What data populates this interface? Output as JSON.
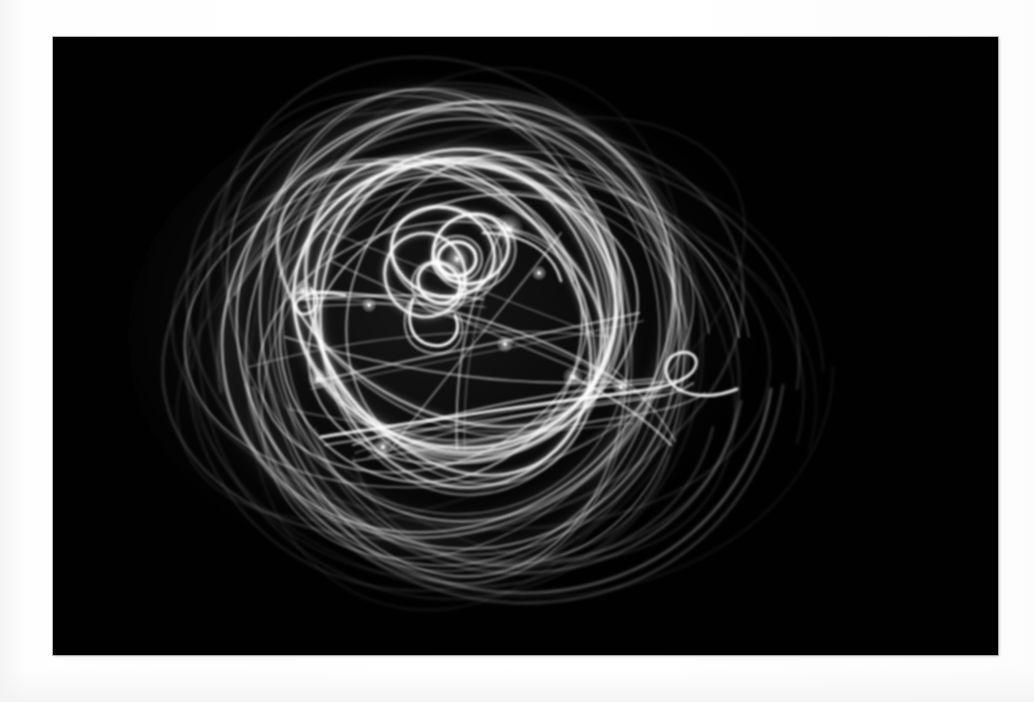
{
  "image": {
    "title": "Light painting long exposure",
    "subject_description": "Dense tangle of overlapping white light trails forming nested loops and ellipses",
    "medium": "photographic print on white paper",
    "orientation": "landscape",
    "canvas": {
      "width": 1034,
      "height": 702
    },
    "print_area": {
      "x": 53,
      "y": 37,
      "width": 945,
      "height": 618
    },
    "caption": ""
  },
  "colors": {
    "page_background": "#fdfdfd",
    "paper_white": "#ffffff",
    "paper_edge_gray": "#f2f2f2",
    "print_background": "#010101",
    "trail_bright": "#ffffff",
    "trail_mid": "#c8c8c8",
    "trail_faint": "#4a4a4a",
    "print_border": "#787878"
  },
  "chart_data": {
    "type": "scatter",
    "xlabel": "",
    "ylabel": "",
    "xlim": [
      0,
      945
    ],
    "ylim": [
      0,
      618
    ],
    "grid": false,
    "legend": "none",
    "trail_bundle": {
      "center": [
        405,
        290
      ],
      "extent_x": [
        130,
        740
      ],
      "extent_y": [
        105,
        555
      ],
      "bright_core": [
        330,
        230,
        560,
        400
      ]
    },
    "series": [
      {
        "name": "outer-ellipse-1",
        "cx": 400,
        "cy": 295,
        "rx": 295,
        "ry": 200,
        "rot": -14,
        "opacity": 0.3,
        "width": 1.8
      },
      {
        "name": "outer-ellipse-2",
        "cx": 410,
        "cy": 300,
        "rx": 285,
        "ry": 215,
        "rot": 22,
        "opacity": 0.26,
        "width": 1.6
      },
      {
        "name": "outer-ellipse-3",
        "cx": 395,
        "cy": 285,
        "rx": 275,
        "ry": 230,
        "rot": 64,
        "opacity": 0.24,
        "width": 1.5
      },
      {
        "name": "outer-ellipse-4",
        "cx": 415,
        "cy": 305,
        "rx": 300,
        "ry": 185,
        "rot": 5,
        "opacity": 0.22,
        "width": 1.4
      },
      {
        "name": "mid-ellipse-1",
        "cx": 395,
        "cy": 280,
        "rx": 235,
        "ry": 205,
        "rot": -35,
        "opacity": 0.48,
        "width": 2.2
      },
      {
        "name": "mid-ellipse-2",
        "cx": 405,
        "cy": 290,
        "rx": 225,
        "ry": 215,
        "rot": 40,
        "opacity": 0.45,
        "width": 2.1
      },
      {
        "name": "mid-ellipse-3",
        "cx": 390,
        "cy": 295,
        "rx": 245,
        "ry": 180,
        "rot": 78,
        "opacity": 0.42,
        "width": 2.0
      },
      {
        "name": "mid-ellipse-4",
        "cx": 420,
        "cy": 275,
        "rx": 215,
        "ry": 195,
        "rot": -62,
        "opacity": 0.4,
        "width": 1.9
      },
      {
        "name": "core-ellipse-1",
        "cx": 400,
        "cy": 270,
        "rx": 160,
        "ry": 140,
        "rot": 12,
        "opacity": 0.78,
        "width": 2.6
      },
      {
        "name": "core-ellipse-2",
        "cx": 410,
        "cy": 265,
        "rx": 150,
        "ry": 150,
        "rot": -30,
        "opacity": 0.74,
        "width": 2.5
      },
      {
        "name": "core-ellipse-3",
        "cx": 395,
        "cy": 280,
        "rx": 170,
        "ry": 125,
        "rot": 55,
        "opacity": 0.7,
        "width": 2.4
      },
      {
        "name": "inner-loop-1",
        "cx": 390,
        "cy": 215,
        "rx": 52,
        "ry": 44,
        "rot": 18,
        "opacity": 0.92,
        "width": 3.0
      },
      {
        "name": "inner-loop-2",
        "cx": 418,
        "cy": 212,
        "rx": 38,
        "ry": 34,
        "rot": -24,
        "opacity": 0.95,
        "width": 3.0
      },
      {
        "name": "inner-loop-3",
        "cx": 372,
        "cy": 238,
        "rx": 42,
        "ry": 40,
        "rot": 70,
        "opacity": 0.88,
        "width": 2.8
      },
      {
        "name": "tiny-loop-1",
        "cx": 404,
        "cy": 222,
        "rx": 19,
        "ry": 17,
        "rot": 0,
        "opacity": 1.0,
        "width": 3.2
      },
      {
        "name": "tiny-loop-2",
        "cx": 386,
        "cy": 246,
        "rx": 22,
        "ry": 19,
        "rot": 35,
        "opacity": 0.96,
        "width": 3.1
      }
    ],
    "bright_nodes": [
      {
        "x": 455,
        "y": 192,
        "intensity": 1.0
      },
      {
        "x": 404,
        "y": 222,
        "intensity": 0.98
      },
      {
        "x": 250,
        "y": 254,
        "intensity": 0.9
      },
      {
        "x": 265,
        "y": 342,
        "intensity": 0.86
      },
      {
        "x": 520,
        "y": 340,
        "intensity": 0.84
      },
      {
        "x": 330,
        "y": 410,
        "intensity": 0.8
      },
      {
        "x": 452,
        "y": 307,
        "intensity": 0.78
      },
      {
        "x": 568,
        "y": 350,
        "intensity": 0.74
      }
    ]
  }
}
